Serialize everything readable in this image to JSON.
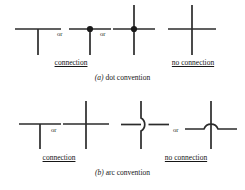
{
  "figure": {
    "line_color": "#2b2b2b",
    "dot_color": "#1a1a1a",
    "background": "#ffffff"
  },
  "panels": [
    {
      "id": "a",
      "caption_tag": "(a)",
      "caption_text": "dot convention",
      "groups": [
        {
          "id": "connection",
          "label": "connection",
          "symbols": [
            {
              "name": "tee-junction-plain",
              "kind": "tee",
              "dot": false
            },
            {
              "name": "tee-junction-dot",
              "kind": "tee",
              "dot": true
            },
            {
              "name": "cross-junction-dot",
              "kind": "cross",
              "dot": true
            }
          ],
          "separators": [
            "or",
            "or"
          ]
        },
        {
          "id": "no-connection",
          "label": "no connection",
          "symbols": [
            {
              "name": "cross-junction-plain",
              "kind": "cross",
              "dot": false
            }
          ],
          "separators": []
        }
      ]
    },
    {
      "id": "b",
      "caption_tag": "(b)",
      "caption_text": "arc convention",
      "groups": [
        {
          "id": "connection",
          "label": "connection",
          "symbols": [
            {
              "name": "tee-junction-plain",
              "kind": "tee",
              "dot": false
            },
            {
              "name": "cross-junction-plain",
              "kind": "cross",
              "dot": false
            }
          ],
          "separators": [
            "or"
          ]
        },
        {
          "id": "no-connection",
          "label": "no connection",
          "symbols": [
            {
              "name": "arc-jog-vertical",
              "kind": "arc-vertical",
              "dot": false
            },
            {
              "name": "arc-hop-horizontal",
              "kind": "arc-horizontal",
              "dot": false
            }
          ],
          "separators": [
            "or"
          ]
        }
      ]
    }
  ],
  "labels": {
    "or": "or",
    "connection": "connection",
    "no_connection": "no connection",
    "caption_a_tag": "(a)",
    "caption_a_text": "dot convention",
    "caption_b_tag": "(b)",
    "caption_b_text": "arc convention"
  }
}
